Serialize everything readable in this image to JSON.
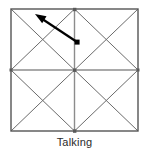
{
  "figure": {
    "caption": "Talking",
    "title": "Talking",
    "background_color": "#ffffff"
  },
  "diagram": {
    "type": "grid-with-diagonals",
    "square": {
      "x": 11,
      "y": 9,
      "width": 127,
      "height": 122,
      "border_color": "#555555",
      "border_width": 1.4
    },
    "grid": {
      "rows": 2,
      "cols": 2,
      "line_color": "#8c8c8c",
      "line_width": 1.4,
      "midline_horizontal_y": 70,
      "midline_vertical_x": 74.5
    },
    "diagonals": {
      "line_color": "#6b6b6b",
      "line_width": 1.0,
      "per_cell": 2,
      "count": 8
    },
    "nodes": {
      "color": "#5a5a5a",
      "size": 3,
      "points": [
        {
          "name": "left-mid",
          "x": 11,
          "y": 70
        },
        {
          "name": "center",
          "x": 74.5,
          "y": 70
        },
        {
          "name": "right-mid",
          "x": 138,
          "y": 70
        },
        {
          "name": "top-mid",
          "x": 74.5,
          "y": 9
        },
        {
          "name": "bottom-mid",
          "x": 74.5,
          "y": 131
        }
      ]
    },
    "arrow": {
      "name": "direction-arrow",
      "color": "#000000",
      "line_width": 2.2,
      "from_x": 77,
      "from_y": 42,
      "to_x": 35,
      "to_y": 14,
      "head_length": 11,
      "head_width": 8,
      "source_marker": {
        "shape": "square",
        "x": 77,
        "y": 42,
        "size": 5,
        "color": "#000000"
      }
    }
  }
}
